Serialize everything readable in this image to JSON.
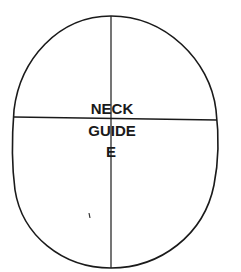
{
  "diagram": {
    "title_line1": "NECK",
    "title_line2": "GUIDE",
    "title_line3": "E",
    "stroke_color": "#1a1a1a",
    "background": "#ffffff",
    "shape": "oval-with-crosshair"
  }
}
